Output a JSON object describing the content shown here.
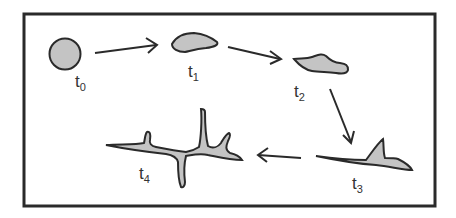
{
  "diagram": {
    "type": "stage-sequence",
    "stages": [
      {
        "id": "t0",
        "label": "t",
        "subscript": "0",
        "shape": "round"
      },
      {
        "id": "t1",
        "label": "t",
        "subscript": "1",
        "shape": "flattened-blob"
      },
      {
        "id": "t2",
        "label": "t",
        "subscript": "2",
        "shape": "irregular-blob"
      },
      {
        "id": "t3",
        "label": "t",
        "subscript": "3",
        "shape": "elongated-with-spike"
      },
      {
        "id": "t4",
        "label": "t",
        "subscript": "4",
        "shape": "branched"
      }
    ],
    "arrows": [
      {
        "from": "t0",
        "to": "t1"
      },
      {
        "from": "t1",
        "to": "t2"
      },
      {
        "from": "t2",
        "to": "t3"
      },
      {
        "from": "t3",
        "to": "t4"
      }
    ],
    "colors": {
      "fill": "#c4c4c4",
      "stroke": "#2a2a2a",
      "frame": "#2a2a2a",
      "background": "#ffffff"
    }
  }
}
